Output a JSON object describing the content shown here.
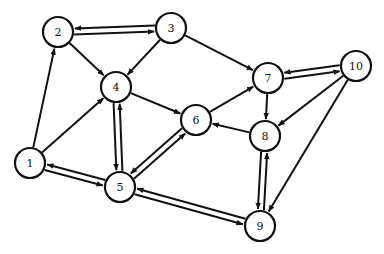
{
  "graph": {
    "directed": true,
    "node_radius": 15,
    "nodes": [
      {
        "id": "1",
        "label": "1",
        "x": 30,
        "y": 163
      },
      {
        "id": "2",
        "label": "2",
        "x": 58,
        "y": 32
      },
      {
        "id": "3",
        "label": "3",
        "x": 171,
        "y": 28
      },
      {
        "id": "4",
        "label": "4",
        "x": 116,
        "y": 87
      },
      {
        "id": "5",
        "label": "5",
        "x": 120,
        "y": 187
      },
      {
        "id": "6",
        "label": "6",
        "x": 196,
        "y": 120
      },
      {
        "id": "7",
        "label": "7",
        "x": 268,
        "y": 78
      },
      {
        "id": "8",
        "label": "8",
        "x": 265,
        "y": 136
      },
      {
        "id": "9",
        "label": "9",
        "x": 260,
        "y": 226
      },
      {
        "id": "10",
        "label": "10",
        "x": 356,
        "y": 66
      }
    ],
    "edges": [
      {
        "from": "1",
        "to": "2"
      },
      {
        "from": "1",
        "to": "4"
      },
      {
        "from": "1",
        "to": "5"
      },
      {
        "from": "5",
        "to": "1"
      },
      {
        "from": "2",
        "to": "3"
      },
      {
        "from": "3",
        "to": "2"
      },
      {
        "from": "2",
        "to": "4"
      },
      {
        "from": "3",
        "to": "4"
      },
      {
        "from": "3",
        "to": "7"
      },
      {
        "from": "4",
        "to": "5"
      },
      {
        "from": "5",
        "to": "4"
      },
      {
        "from": "4",
        "to": "6"
      },
      {
        "from": "5",
        "to": "6"
      },
      {
        "from": "6",
        "to": "5"
      },
      {
        "from": "6",
        "to": "7"
      },
      {
        "from": "8",
        "to": "6"
      },
      {
        "from": "7",
        "to": "8"
      },
      {
        "from": "7",
        "to": "10"
      },
      {
        "from": "10",
        "to": "7"
      },
      {
        "from": "10",
        "to": "8"
      },
      {
        "from": "10",
        "to": "9"
      },
      {
        "from": "8",
        "to": "9"
      },
      {
        "from": "9",
        "to": "8"
      },
      {
        "from": "5",
        "to": "9"
      },
      {
        "from": "9",
        "to": "5"
      }
    ],
    "colors": {
      "stroke": "#111111",
      "node_fill": "#ffffff",
      "background": "#ffffff"
    }
  }
}
